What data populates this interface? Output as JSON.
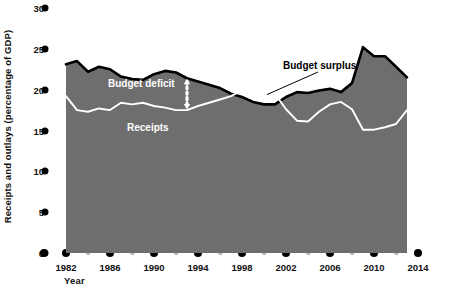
{
  "chart_data": {
    "type": "area",
    "title": "",
    "xlabel": "Year",
    "ylabel": "Receipts and outlays (percentage of GDP)",
    "ylim": [
      0,
      30
    ],
    "xlim": [
      1981,
      2014
    ],
    "yticks": [
      0,
      5,
      10,
      15,
      20,
      25,
      30
    ],
    "ytick_labels": [
      "0",
      "5",
      "10",
      "15",
      "20",
      "25",
      "30"
    ],
    "xticks_major": [
      1982,
      1986,
      1990,
      1994,
      1998,
      2002,
      2006,
      2010,
      2014
    ],
    "xtick_labels": [
      "1982",
      "1986",
      "1990",
      "1994",
      "1998",
      "2002",
      "2006",
      "2010",
      "2014"
    ],
    "xticks_minor": [
      1984,
      1988,
      1992,
      1996,
      2000,
      2004,
      2008,
      2012
    ],
    "grid": false,
    "legend_position": "inline-annotations",
    "x": [
      1982,
      1983,
      1984,
      1985,
      1986,
      1987,
      1988,
      1989,
      1990,
      1991,
      1992,
      1993,
      1994,
      1995,
      1996,
      1997,
      1998,
      1999,
      2000,
      2001,
      2002,
      2003,
      2004,
      2005,
      2006,
      2007,
      2008,
      2009,
      2010,
      2011,
      2012,
      2013
    ],
    "series": [
      {
        "name": "Outlays",
        "color": "#000000",
        "values": [
          23.1,
          23.5,
          22.2,
          22.8,
          22.5,
          21.6,
          21.3,
          21.2,
          21.9,
          22.3,
          22.1,
          21.4,
          21.0,
          20.6,
          20.2,
          19.5,
          19.1,
          18.5,
          18.2,
          18.2,
          19.1,
          19.7,
          19.6,
          19.9,
          20.1,
          19.7,
          20.8,
          25.2,
          24.1,
          24.1,
          22.8,
          21.5
        ]
      },
      {
        "name": "Receipts",
        "color": "#ffffff",
        "values": [
          19.2,
          17.5,
          17.3,
          17.7,
          17.5,
          18.4,
          18.2,
          18.4,
          18.0,
          17.8,
          17.5,
          17.5,
          18.0,
          18.4,
          18.8,
          19.2,
          19.9,
          19.8,
          20.6,
          19.5,
          17.6,
          16.2,
          16.1,
          17.3,
          18.2,
          18.5,
          17.6,
          15.1,
          15.1,
          15.4,
          15.8,
          17.5
        ]
      }
    ],
    "annotations": [
      {
        "id": "outlays",
        "text": "Outlays",
        "style": "light"
      },
      {
        "id": "budget_deficit",
        "text": "Budget deficit",
        "style": "light"
      },
      {
        "id": "receipts",
        "text": "Receipts",
        "style": "light"
      },
      {
        "id": "budget_surplus",
        "text": "Budget surplus",
        "style": "dark"
      }
    ],
    "colors": {
      "deficit_fill": "#6e6e6e",
      "outlays_line": "#000000",
      "receipts_line": "#ffffff",
      "surplus_fill": "#ffffff",
      "axis_dot_major": "#000000",
      "axis_dot_minor": "#b8b8b8",
      "background": "#ffffff"
    }
  },
  "source_note": ""
}
